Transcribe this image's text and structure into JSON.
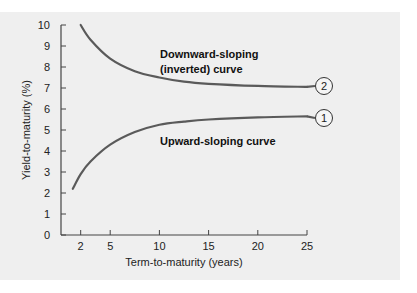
{
  "chart_data": {
    "type": "line",
    "title": "",
    "xlabel": "Term-to-maturity (years)",
    "ylabel": "Yield-to-maturity (%)",
    "xlim": [
      0,
      25
    ],
    "ylim": [
      0,
      10
    ],
    "x_ticks": [
      2,
      5,
      10,
      15,
      20,
      25
    ],
    "y_ticks": [
      0,
      1,
      2,
      3,
      4,
      5,
      6,
      7,
      8,
      9,
      10
    ],
    "grid": false,
    "series": [
      {
        "name": "Downward-sloping (inverted) curve",
        "marker_label": "2",
        "label_lines": [
          "Downward-sloping",
          "(inverted) curve"
        ],
        "x": [
          2,
          3,
          5,
          7.5,
          10,
          12.5,
          15,
          20,
          25
        ],
        "values": [
          10.0,
          9.3,
          8.4,
          7.8,
          7.5,
          7.3,
          7.2,
          7.1,
          7.05
        ]
      },
      {
        "name": "Upward-sloping curve",
        "marker_label": "1",
        "label_lines": [
          "Upward-sloping curve"
        ],
        "x": [
          1.2,
          2,
          3,
          5,
          7.5,
          10,
          12.5,
          15,
          20,
          25
        ],
        "values": [
          2.2,
          2.9,
          3.5,
          4.3,
          4.9,
          5.25,
          5.4,
          5.5,
          5.6,
          5.65
        ]
      }
    ],
    "colors": {
      "curve": "#5a5a5a",
      "axis": "#444444",
      "background": "#efefef"
    }
  }
}
